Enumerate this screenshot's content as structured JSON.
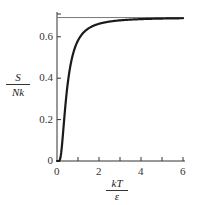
{
  "chart_data": {
    "type": "line",
    "title": "",
    "xlabel": {
      "numerator": "kT",
      "denominator": "ε"
    },
    "ylabel": {
      "numerator": "S",
      "denominator": "Nk"
    },
    "xlim": [
      0,
      6
    ],
    "ylim": [
      0,
      0.72
    ],
    "x_ticks": [
      0,
      2,
      4,
      6
    ],
    "x_tick_labels": [
      "0",
      "2",
      "4",
      "6"
    ],
    "x_minor_ticks": [
      1,
      3,
      5
    ],
    "y_ticks": [
      0,
      0.2,
      0.4,
      0.6
    ],
    "y_tick_labels": [
      "0",
      "0.2",
      "0.4",
      "0.6"
    ],
    "grid": false,
    "legend": null,
    "series": [
      {
        "name": "S/Nk (two-state system entropy)",
        "x": [
          0,
          0.2,
          0.3,
          0.4,
          0.5,
          0.6,
          0.7,
          0.8,
          1.0,
          1.2,
          1.5,
          2.0,
          2.5,
          3.0,
          3.5,
          4.0,
          5.0,
          6.0
        ],
        "values": [
          0,
          0.0034,
          0.0372,
          0.0966,
          0.1624,
          0.2237,
          0.277,
          0.3225,
          0.393,
          0.444,
          0.499,
          0.5532,
          0.5862,
          0.6081,
          0.6233,
          0.6344,
          0.6494,
          0.659
        ],
        "color": "#1a1a1a"
      },
      {
        "name": "asymptote ln 2",
        "x": [
          0,
          6
        ],
        "values": [
          0.693,
          0.693
        ],
        "color": "#777777"
      }
    ],
    "annotations": []
  }
}
